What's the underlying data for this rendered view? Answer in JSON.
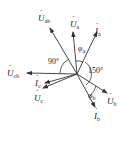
{
  "diagram": {
    "origin": [
      77,
      74
    ],
    "stroke_color": "#333333",
    "phasors": [
      {
        "id": "U_ab",
        "symbol": "U",
        "sub": "ab",
        "tip": [
          50,
          28
        ],
        "label_pos": [
          38,
          21
        ]
      },
      {
        "id": "U_a",
        "symbol": "U",
        "sub": "a",
        "tip": [
          73,
          32
        ],
        "label_pos": [
          70,
          27
        ]
      },
      {
        "id": "I_a",
        "symbol": "I",
        "sub": "a",
        "tip": [
          97,
          32
        ],
        "label_pos": [
          95,
          34
        ]
      },
      {
        "id": "U_cb",
        "symbol": "U",
        "sub": "cb",
        "tip": [
          27,
          73
        ],
        "label_pos": [
          8,
          76
        ]
      },
      {
        "id": "I_c",
        "symbol": "I",
        "sub": "c",
        "tip": [
          45,
          83
        ],
        "label_pos": [
          35,
          86
        ]
      },
      {
        "id": "U_c",
        "symbol": "U",
        "sub": "c",
        "tip": [
          43,
          88
        ],
        "label_pos": [
          34,
          100
        ]
      },
      {
        "id": "U_b",
        "symbol": "U",
        "sub": "b",
        "tip": [
          107,
          93
        ],
        "label_pos": [
          108,
          104
        ]
      },
      {
        "id": "I_b",
        "symbol": "I",
        "sub": "b",
        "tip": [
          95,
          107
        ],
        "label_pos": [
          94,
          118
        ]
      }
    ],
    "angles": [
      {
        "label": "90°",
        "pos": [
          51,
          63
        ]
      },
      {
        "label": "150°",
        "pos": [
          88,
          72
        ]
      },
      {
        "label": "φ",
        "sub": "a",
        "pos": [
          79,
          50
        ]
      },
      {
        "label": "φ",
        "sub": "b",
        "pos": [
          89,
          99
        ]
      }
    ]
  }
}
